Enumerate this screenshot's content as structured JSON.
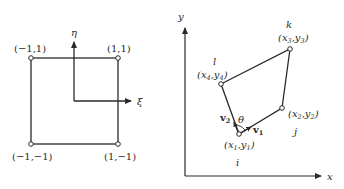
{
  "left_panel": {
    "title": "Parent (natural) element",
    "axes": {
      "horizontal": "ξ",
      "vertical": "η"
    },
    "corners": [
      {
        "label": "(−1,1)",
        "pos": "top-left"
      },
      {
        "label": "(1,1)",
        "pos": "top-right"
      },
      {
        "label": "(−1,−1)",
        "pos": "bottom-left"
      },
      {
        "label": "(1,−1)",
        "pos": "bottom-right"
      }
    ]
  },
  "right_panel": {
    "title": "Physical quadrilateral element",
    "axes": {
      "horizontal": "x",
      "vertical": "y"
    },
    "nodes": [
      {
        "name": "i",
        "coord_base": "(x",
        "coord_sub1": "1",
        "coord_mid": ",y",
        "coord_sub2": "1",
        "coord_end": ")"
      },
      {
        "name": "j",
        "coord_base": "(x",
        "coord_sub1": "2",
        "coord_mid": ",y",
        "coord_sub2": "2",
        "coord_end": ")"
      },
      {
        "name": "k",
        "coord_base": "(x",
        "coord_sub1": "3",
        "coord_mid": ",y",
        "coord_sub2": "3",
        "coord_end": ")"
      },
      {
        "name": "l",
        "coord_base": "(x",
        "coord_sub1": "4",
        "coord_mid": ",y",
        "coord_sub2": "4",
        "coord_end": ")"
      }
    ],
    "vectors": [
      {
        "name": "v",
        "sub": "1"
      },
      {
        "name": "v",
        "sub": "2"
      }
    ],
    "angle_label": "θ"
  },
  "colors": {
    "stroke": "#2a2a2a",
    "background": "#ffffff"
  }
}
